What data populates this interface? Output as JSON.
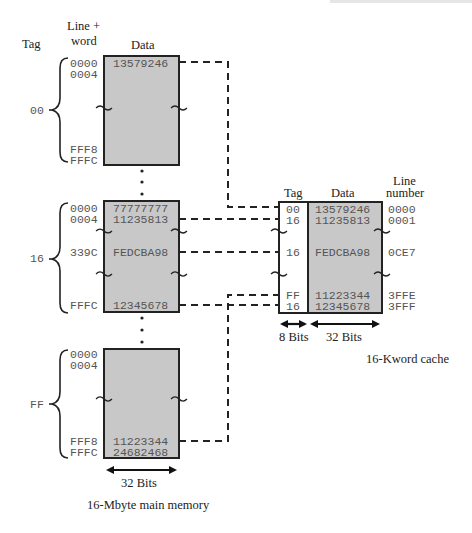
{
  "main_memory": {
    "caption": "16-Mbyte main memory",
    "header_tag": "Tag",
    "header_line_word": [
      "Line +",
      "word"
    ],
    "header_data": "Data",
    "width_label": "32 Bits",
    "blocks": [
      {
        "tag": "00",
        "rows": [
          {
            "addr": "0000",
            "data": "13579246"
          },
          {
            "addr": "0004",
            "data": ""
          },
          {
            "addr": "FFF8",
            "data": ""
          },
          {
            "addr": "FFFC",
            "data": ""
          }
        ]
      },
      {
        "tag": "16",
        "rows": [
          {
            "addr": "0000",
            "data": "77777777"
          },
          {
            "addr": "0004",
            "data": "11235813"
          },
          {
            "addr": "339C",
            "data": "FEDCBA98"
          },
          {
            "addr": "FFFC",
            "data": "12345678"
          }
        ]
      },
      {
        "tag": "FF",
        "rows": [
          {
            "addr": "0000",
            "data": ""
          },
          {
            "addr": "0004",
            "data": ""
          },
          {
            "addr": "FFF8",
            "data": "11223344"
          },
          {
            "addr": "FFFC",
            "data": "24682468"
          }
        ]
      }
    ]
  },
  "cache": {
    "caption": "16-Kword cache",
    "header_tag": "Tag",
    "header_data": "Data",
    "header_line_number": [
      "Line",
      "number"
    ],
    "tag_width_label": "8 Bits",
    "data_width_label": "32 Bits",
    "rows": [
      {
        "tag": "00",
        "data": "13579246",
        "line": "0000"
      },
      {
        "tag": "16",
        "data": "11235813",
        "line": "0001"
      },
      {
        "tag": "16",
        "data": "FEDCBA98",
        "line": "0CE7"
      },
      {
        "tag": "FF",
        "data": "11223344",
        "line": "3FFE"
      },
      {
        "tag": "16",
        "data": "12345678",
        "line": "3FFF"
      }
    ]
  },
  "colors": {
    "block_fill": "#c8c8c8",
    "stroke": "#222222",
    "mono_text": "#555555"
  }
}
